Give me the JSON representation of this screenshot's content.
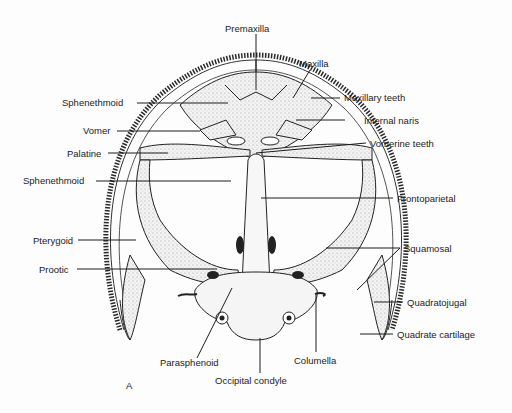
{
  "figure": {
    "panel_letter": "A",
    "colors": {
      "ink": "#1c1c1c",
      "bone_fill": "#f2f2f2",
      "stipple": "#9a9a9a",
      "background": "#fdfdfd"
    }
  },
  "labels": {
    "premaxilla": "Premaxilla",
    "maxilla": "Maxilla",
    "maxillary_teeth": "Maxillary teeth",
    "sphenethmoid_upper": "Sphenethmoid",
    "internal_naris": "Internal naris",
    "vomer": "Vomer",
    "palatine": "Palatine",
    "vomerine_teeth": "Vomerine teeth",
    "sphenethmoid_lower": "Sphenethmoid",
    "frontoparietal": "Frontoparietal",
    "pterygoid": "Pterygoid",
    "squamosal": "Squamosal",
    "prootic": "Prootic",
    "quadratojugal": "Quadratojugal",
    "quadrate_cartilage": "Quadrate cartilage",
    "parasphenoid": "Parasphenoid",
    "columella": "Columella",
    "occipital_condyle": "Occipital condyle"
  }
}
